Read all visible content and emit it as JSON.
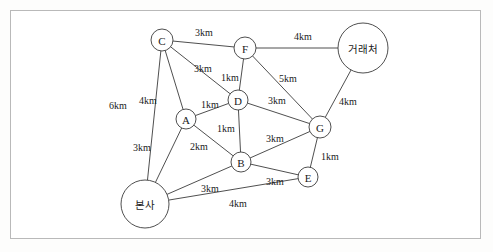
{
  "figure": {
    "kind": "weighted-undirected-graph",
    "unit": "km",
    "border_color": "#b9b9b9",
    "line_color": "#3b3b3b",
    "node_fill": "#ffffff",
    "background": "#ffffff"
  },
  "nodes": [
    {
      "id": "hq",
      "label": "본사",
      "x": 145,
      "y": 204,
      "r": 24,
      "size": "large"
    },
    {
      "id": "client",
      "label": "거래처",
      "x": 363,
      "y": 48,
      "r": 25,
      "size": "large"
    },
    {
      "id": "A",
      "label": "A",
      "x": 186,
      "y": 119,
      "r": 10,
      "size": "small"
    },
    {
      "id": "B",
      "label": "B",
      "x": 241,
      "y": 162,
      "r": 10,
      "size": "small"
    },
    {
      "id": "C",
      "label": "C",
      "x": 162,
      "y": 40,
      "r": 11,
      "size": "small"
    },
    {
      "id": "D",
      "label": "D",
      "x": 238,
      "y": 100,
      "r": 10,
      "size": "small"
    },
    {
      "id": "E",
      "label": "E",
      "x": 308,
      "y": 177,
      "r": 10,
      "size": "small"
    },
    {
      "id": "F",
      "label": "F",
      "x": 245,
      "y": 48,
      "r": 11,
      "size": "small"
    },
    {
      "id": "G",
      "label": "G",
      "x": 320,
      "y": 127,
      "r": 11,
      "size": "small"
    }
  ],
  "edges": [
    {
      "from": "C",
      "to": "F",
      "weight": 3,
      "label": "3km",
      "lx": 204,
      "ly": 32
    },
    {
      "from": "F",
      "to": "client",
      "weight": 4,
      "label": "4km",
      "lx": 303,
      "ly": 36
    },
    {
      "from": "C",
      "to": "D",
      "weight": 3,
      "label": "3km",
      "lx": 203,
      "ly": 68
    },
    {
      "from": "F",
      "to": "D",
      "weight": 1,
      "label": "1km",
      "lx": 230,
      "ly": 77
    },
    {
      "from": "F",
      "to": "G",
      "weight": 5,
      "label": "5km",
      "lx": 288,
      "ly": 78
    },
    {
      "from": "client",
      "to": "G",
      "weight": 4,
      "label": "4km",
      "lx": 348,
      "ly": 101
    },
    {
      "from": "C",
      "to": "hq",
      "weight": 6,
      "label": "6km",
      "lx": 118,
      "ly": 105
    },
    {
      "from": "C",
      "to": "A",
      "weight": 4,
      "label": "4km",
      "lx": 148,
      "ly": 100
    },
    {
      "from": "A",
      "to": "D",
      "weight": 1,
      "label": "1km",
      "lx": 210,
      "ly": 104
    },
    {
      "from": "D",
      "to": "G",
      "weight": 3,
      "label": "3km",
      "lx": 277,
      "ly": 100
    },
    {
      "from": "D",
      "to": "B",
      "weight": 1,
      "label": "1km",
      "lx": 226,
      "ly": 128
    },
    {
      "from": "B",
      "to": "G",
      "weight": 3,
      "label": "3km",
      "lx": 275,
      "ly": 138
    },
    {
      "from": "A",
      "to": "hq",
      "weight": 3,
      "label": "3km",
      "lx": 142,
      "ly": 147
    },
    {
      "from": "A",
      "to": "B",
      "weight": 2,
      "label": "2km",
      "lx": 199,
      "ly": 146
    },
    {
      "from": "G",
      "to": "E",
      "weight": 1,
      "label": "1km",
      "lx": 330,
      "ly": 156
    },
    {
      "from": "hq",
      "to": "B",
      "weight": 3,
      "label": "3km",
      "lx": 210,
      "ly": 188
    },
    {
      "from": "B",
      "to": "E",
      "weight": 3,
      "label": "3km",
      "lx": 275,
      "ly": 181
    },
    {
      "from": "hq",
      "to": "E",
      "weight": 4,
      "label": "4km",
      "lx": 238,
      "ly": 203
    }
  ]
}
